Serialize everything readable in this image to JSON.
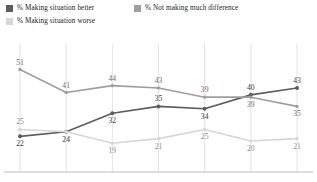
{
  "legend": {
    "items": [
      {
        "label": "% Making situation better",
        "color": "#5c5c5c",
        "icon": "legend-swatch-icon"
      },
      {
        "label": "% Not making much difference",
        "color": "#9e9e9e",
        "icon": "legend-swatch-icon"
      },
      {
        "label": "% Making situation worse",
        "color": "#d6d6d6",
        "icon": "legend-swatch-icon"
      }
    ]
  },
  "chart_data": {
    "type": "line",
    "title": "",
    "subtitle": "",
    "xlabel": "",
    "ylabel": "",
    "ylim": [
      10,
      56
    ],
    "grid": "vertical",
    "legend_position": "top-left",
    "x": [
      1,
      2,
      3,
      4,
      5,
      6,
      7
    ],
    "categories": [
      "",
      "",
      "",
      "",
      "",
      "",
      ""
    ],
    "series": [
      {
        "name": "% Making situation better",
        "color": "#5c5c5c",
        "values": [
          22,
          24,
          32,
          35,
          34,
          40,
          43
        ],
        "label_positions": [
          "below",
          "below",
          "below",
          "above",
          "below",
          "above",
          "above"
        ]
      },
      {
        "name": "% Not making much difference",
        "color": "#9e9e9e",
        "values": [
          51,
          41,
          44,
          43,
          39,
          39,
          35
        ],
        "label_positions": [
          "above",
          "above",
          "above",
          "above",
          "above",
          "below",
          "below"
        ]
      },
      {
        "name": "% Making situation worse",
        "color": "#d6d6d6",
        "values": [
          25,
          24,
          19,
          21,
          25,
          20,
          21
        ],
        "label_positions": [
          "above",
          "below",
          "below",
          "below",
          "below",
          "below",
          "below"
        ]
      }
    ]
  }
}
